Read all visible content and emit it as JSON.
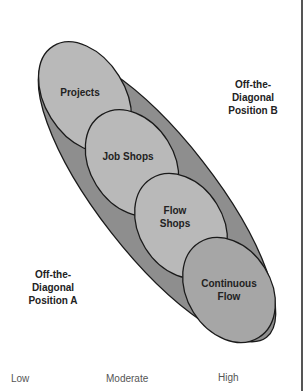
{
  "diagram": {
    "outer_region": {
      "label": "",
      "fill": "#8e8e8e"
    },
    "ellipses": [
      {
        "label_lines": [
          "Projects"
        ],
        "fill": "#b9b9b9"
      },
      {
        "label_lines": [
          "Job Shops"
        ],
        "fill": "#b9b9b9"
      },
      {
        "label_lines": [
          "Flow",
          "Shops"
        ],
        "fill": "#b9b9b9"
      },
      {
        "label_lines": [
          "Continuous",
          "Flow"
        ],
        "fill": "#a6a6a6"
      }
    ],
    "off_diagonal_b": {
      "lines": [
        "Off-the-",
        "Diagonal",
        "Position B"
      ]
    },
    "off_diagonal_a": {
      "lines": [
        "Off-the-",
        "Diagonal",
        "Position A"
      ]
    }
  },
  "x_axis": {
    "ticks": [
      "Low",
      "Moderate",
      "High"
    ]
  },
  "colors": {
    "outer": "#8e8e8e",
    "inner": "#b9b9b9",
    "stroke": "#1a1a1a",
    "frame_line": "#555555"
  }
}
